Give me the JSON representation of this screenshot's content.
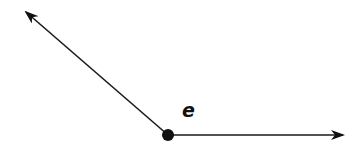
{
  "diagram": {
    "type": "angle",
    "vertex": {
      "x": 168,
      "y": 135,
      "radius": 6
    },
    "rays": [
      {
        "name": "ray-upper-left",
        "from": {
          "x": 168,
          "y": 135
        },
        "to": {
          "x": 26,
          "y": 12
        }
      },
      {
        "name": "ray-right",
        "from": {
          "x": 168,
          "y": 135
        },
        "to": {
          "x": 343,
          "y": 135
        }
      }
    ],
    "label": {
      "text": "e",
      "x": 182,
      "y": 101
    },
    "colors": {
      "stroke": "#1a1a1a",
      "fill": "#111111",
      "background": "#ffffff"
    }
  }
}
